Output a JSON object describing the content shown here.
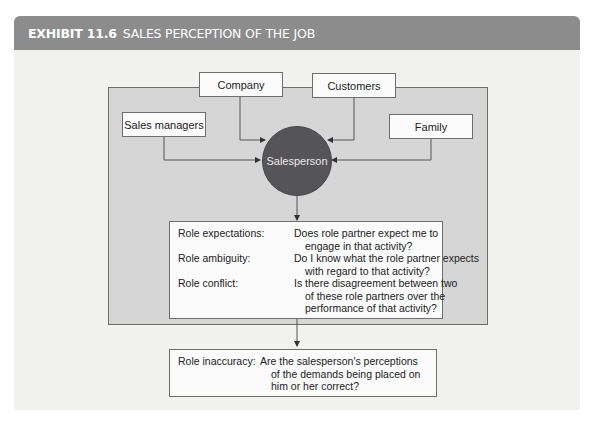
{
  "exhibit": {
    "number": "EXHIBIT 11.6",
    "title": "SALES PERCEPTION OF THE JOB",
    "header_color": "#8c8c8c"
  },
  "nodes": {
    "company": "Company",
    "customers": "Customers",
    "sales_managers": "Sales managers",
    "family": "Family",
    "salesperson": "Salesperson"
  },
  "roles_box": {
    "items": [
      {
        "label": "Role expectations:",
        "lines": [
          "Does role partner expect me to",
          "engage in that activity?"
        ]
      },
      {
        "label": "Role ambiguity:",
        "lines": [
          "Do I know what the role partner expects",
          "with regard to that activity?"
        ]
      },
      {
        "label": "Role conflict:",
        "lines": [
          "Is there disagreement between two",
          "of these role partners over the",
          "performance of that activity?"
        ]
      }
    ]
  },
  "inaccuracy_box": {
    "label": "Role inaccuracy:",
    "lines": [
      "Are the salesperson's perceptions",
      "of the demands being placed on",
      "him or her correct?"
    ]
  },
  "colors": {
    "frame_fill": "#d6d6d6",
    "circle_fill": "#555458",
    "card_bg": "#f1f1f0"
  }
}
